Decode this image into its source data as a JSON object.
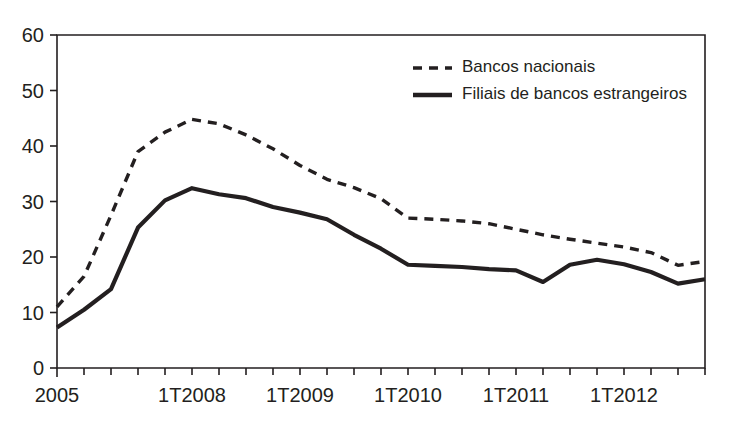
{
  "chart_data": {
    "type": "line",
    "title": "",
    "subtitle": "",
    "xlabel": "",
    "ylabel": "",
    "ylim": [
      0,
      60
    ],
    "yticks": [
      0,
      10,
      20,
      30,
      40,
      50,
      60
    ],
    "ytick_labels": [
      "0",
      "10",
      "20",
      "30",
      "40",
      "50",
      "60"
    ],
    "xtick_labels": [
      "2005",
      "1T2008",
      "1T2009",
      "1T2010",
      "1T2011",
      "1T2012"
    ],
    "xtick_label_positions": [
      0,
      5,
      9,
      13,
      17,
      21
    ],
    "grid": false,
    "legend_position": "top-right",
    "n_points": 25,
    "x": [
      0,
      1,
      2,
      3,
      4,
      5,
      6,
      7,
      8,
      9,
      10,
      11,
      12,
      13,
      14,
      15,
      16,
      17,
      18,
      19,
      20,
      21,
      22,
      23,
      24
    ],
    "series": [
      {
        "name": "Bancos nacionais",
        "style": "dashed",
        "color": "#231f20",
        "values": [
          11.0,
          16.5,
          27.5,
          39.0,
          42.5,
          44.8,
          44.0,
          42.0,
          39.5,
          36.5,
          34.0,
          32.5,
          30.5,
          27.0,
          26.8,
          26.5,
          26.0,
          25.0,
          24.0,
          23.2,
          22.5,
          21.8,
          20.8,
          18.5,
          19.2
        ]
      },
      {
        "name": "Filiais de bancos estrangeiros",
        "style": "solid",
        "color": "#231f20",
        "values": [
          7.3,
          10.5,
          14.2,
          25.3,
          30.2,
          32.4,
          31.3,
          30.6,
          29.0,
          28.0,
          26.8,
          24.0,
          21.5,
          18.6,
          18.4,
          18.2,
          17.8,
          17.6,
          15.5,
          18.6,
          19.5,
          18.7,
          17.3,
          15.2,
          16.0
        ]
      }
    ]
  },
  "legend": {
    "items": [
      {
        "label": "Bancos nacionais",
        "style": "dashed"
      },
      {
        "label": "Filiais de bancos estrangeiros",
        "style": "solid"
      }
    ]
  },
  "colors": {
    "ink": "#231f20",
    "background": "#ffffff"
  }
}
